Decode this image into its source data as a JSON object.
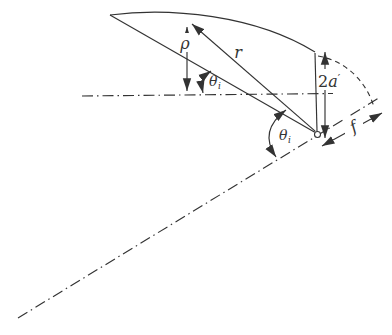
{
  "figure": {
    "background": "#ffffff",
    "line_color": "#333333",
    "labels": {
      "rho": "ρ",
      "radius": "r",
      "theta_upper": {
        "base": "θ",
        "sub": "i"
      },
      "theta_lower": {
        "base": "θ",
        "sub": "i"
      },
      "aperture": {
        "coefficient": "2",
        "symbol": "a",
        "prime": "′"
      },
      "focal_length": "f"
    }
  }
}
